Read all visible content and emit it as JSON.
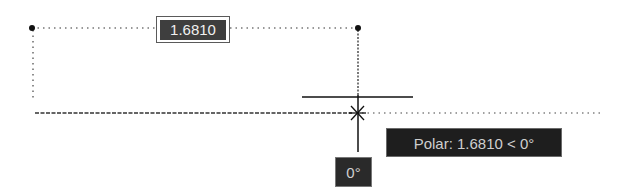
{
  "viewport": {
    "background": "#ffffff",
    "line_color": "#222222"
  },
  "dimension": {
    "value": "1.6810",
    "start_point": {
      "x": 32,
      "y": 28
    },
    "end_point": {
      "x": 358,
      "y": 28
    }
  },
  "polar_tooltip": {
    "text": "Polar: 1.6810 < 0°"
  },
  "angle_tooltip": {
    "text": "0°"
  },
  "cursor": {
    "type": "crosshair",
    "x": 357,
    "y": 113
  },
  "tracking_line": {
    "angle": "0°",
    "y": 113
  }
}
